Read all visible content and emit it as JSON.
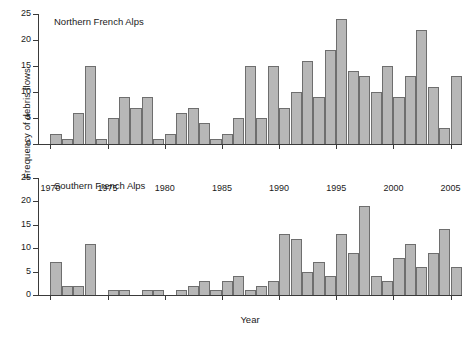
{
  "chart_data": {
    "type": "bar",
    "title": "",
    "xlabel": "Year",
    "ylabel": "Frequency of debris flows",
    "ylim": [
      0,
      25
    ],
    "xlim": [
      1969,
      2006
    ],
    "grid": false,
    "legend": "none",
    "bar_color": "#b7b7b7",
    "bar_edge_color": "#6e6e6e",
    "y_ticks": [
      0,
      5,
      10,
      15,
      20,
      25
    ],
    "x_ticks": [
      1970,
      1975,
      1980,
      1985,
      1990,
      1995,
      2000,
      2005
    ],
    "panels": [
      {
        "name": "northern",
        "title": "Northern French Alps",
        "categories": [
          1970,
          1971,
          1972,
          1973,
          1974,
          1975,
          1976,
          1977,
          1978,
          1979,
          1980,
          1981,
          1982,
          1983,
          1984,
          1985,
          1986,
          1987,
          1988,
          1989,
          1990,
          1991,
          1992,
          1993,
          1994,
          1995,
          1996,
          1997,
          1998,
          1999,
          2000,
          2001,
          2002,
          2003,
          2004,
          2005
        ],
        "values": [
          2,
          1,
          6,
          15,
          1,
          5,
          9,
          7,
          9,
          1,
          2,
          6,
          7,
          4,
          1,
          2,
          5,
          15,
          5,
          15,
          7,
          10,
          16,
          9,
          18,
          24,
          14,
          13,
          10,
          15,
          9,
          13,
          22,
          11,
          3,
          13
        ]
      },
      {
        "name": "southern",
        "title": "Southern French Alps",
        "categories": [
          1970,
          1971,
          1972,
          1973,
          1974,
          1975,
          1976,
          1977,
          1978,
          1979,
          1980,
          1981,
          1982,
          1983,
          1984,
          1985,
          1986,
          1987,
          1988,
          1989,
          1990,
          1991,
          1992,
          1993,
          1994,
          1995,
          1996,
          1997,
          1998,
          1999,
          2000,
          2001,
          2002,
          2003,
          2004,
          2005
        ],
        "values": [
          7,
          2,
          2,
          11,
          0,
          1,
          1,
          0,
          1,
          1,
          0,
          1,
          2,
          3,
          1,
          3,
          4,
          1,
          2,
          3,
          13,
          12,
          5,
          7,
          4,
          13,
          9,
          19,
          4,
          3,
          8,
          11,
          6,
          9,
          14,
          6,
          21,
          18
        ]
      }
    ]
  },
  "axes": {
    "ylabel": "Frequency of debris flows",
    "xlabel": "Year"
  },
  "caption": {
    "text": ""
  }
}
